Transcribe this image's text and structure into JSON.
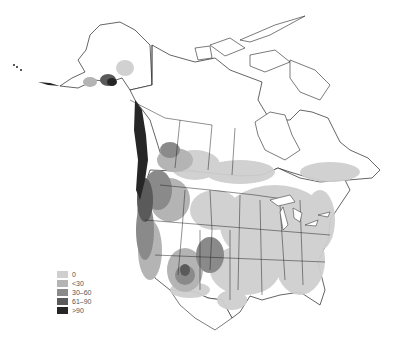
{
  "map": {
    "region": "North America",
    "style": "grayscale choropleth with province/state boundaries",
    "colors": {
      "background": "#ffffff",
      "outline": "#222222",
      "level_0": "#cfcfcf",
      "level_1": "#b4b4b4",
      "level_2": "#8a8a8a",
      "level_3": "#5a5a5a",
      "level_4": "#262626"
    }
  },
  "legend": {
    "items": [
      {
        "label": "0",
        "color": "#cfcfcf"
      },
      {
        "label": "<30",
        "color": "#b4b4b4"
      },
      {
        "label": "30–60",
        "color": "#8a8a8a"
      },
      {
        "label": "61–90",
        "color": "#5a5a5a"
      },
      {
        "label": ">90",
        "color": "#262626"
      }
    ]
  }
}
